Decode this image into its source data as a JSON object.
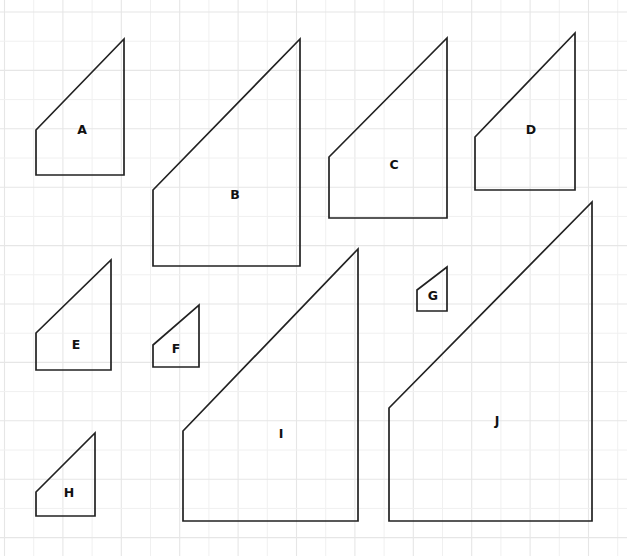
{
  "canvas": {
    "width": 627,
    "height": 556,
    "background_color": "#ffffff",
    "stroke_color": "#222222",
    "label_color": "#111111"
  },
  "grid": {
    "visible": true,
    "color": "#ededed",
    "spacing_px": 29.2,
    "origin_x": 4.5,
    "origin_y": 12.0,
    "line_width": 1
  },
  "figure": {
    "type": "geometry-worksheet",
    "shape_count": 10
  },
  "shapes": [
    {
      "label": "A",
      "x_left": 36,
      "x_right": 124,
      "y_bottom": 175,
      "y_top_left": 130,
      "y_top_right": 39,
      "label_x": 82,
      "label_y": 130,
      "points": "36,130 124,39 124,175 36,175"
    },
    {
      "label": "B",
      "x_left": 153,
      "x_right": 300,
      "y_bottom": 266,
      "y_top_left": 190,
      "y_top_right": 39,
      "label_x": 235,
      "label_y": 195,
      "points": "153,190 300,39 300,266 153,266"
    },
    {
      "label": "C",
      "x_left": 329,
      "x_right": 447,
      "y_bottom": 218,
      "y_top_left": 157,
      "y_top_right": 38,
      "label_x": 394,
      "label_y": 165,
      "points": "329,157 447,38 447,218 329,218"
    },
    {
      "label": "D",
      "x_left": 475,
      "x_right": 575,
      "y_bottom": 190,
      "y_top_left": 137,
      "y_top_right": 33,
      "label_x": 531,
      "label_y": 130,
      "points": "475,137 575,33 575,190 475,190"
    },
    {
      "label": "E",
      "x_left": 36,
      "x_right": 111,
      "y_bottom": 370,
      "y_top_left": 333,
      "y_top_right": 260,
      "label_x": 76,
      "label_y": 345,
      "points": "36,333 111,260 111,370 36,370"
    },
    {
      "label": "F",
      "x_left": 153,
      "x_right": 199,
      "y_bottom": 367,
      "y_top_left": 345,
      "y_top_right": 305,
      "label_x": 176,
      "label_y": 349,
      "points": "153,345 199,305 199,367 153,367"
    },
    {
      "label": "G",
      "x_left": 417,
      "x_right": 447,
      "y_bottom": 311,
      "y_top_left": 290,
      "y_top_right": 267,
      "label_x": 433,
      "label_y": 296,
      "points": "417,290 447,267 447,311 417,311"
    },
    {
      "label": "H",
      "x_left": 36,
      "x_right": 95,
      "y_bottom": 516,
      "y_top_left": 492,
      "y_top_right": 433,
      "label_x": 69,
      "label_y": 493,
      "points": "36,492 95,433 95,516 36,516"
    },
    {
      "label": "I",
      "x_left": 183,
      "x_right": 358,
      "y_bottom": 521,
      "y_top_left": 431,
      "y_top_right": 249,
      "label_x": 281,
      "label_y": 434,
      "points": "183,431 358,249 358,521 183,521"
    },
    {
      "label": "J",
      "x_left": 389,
      "x_right": 592,
      "y_bottom": 521,
      "y_top_left": 408,
      "y_top_right": 202,
      "label_x": 497,
      "label_y": 421,
      "points": "389,408 592,202 592,521 389,521"
    }
  ]
}
